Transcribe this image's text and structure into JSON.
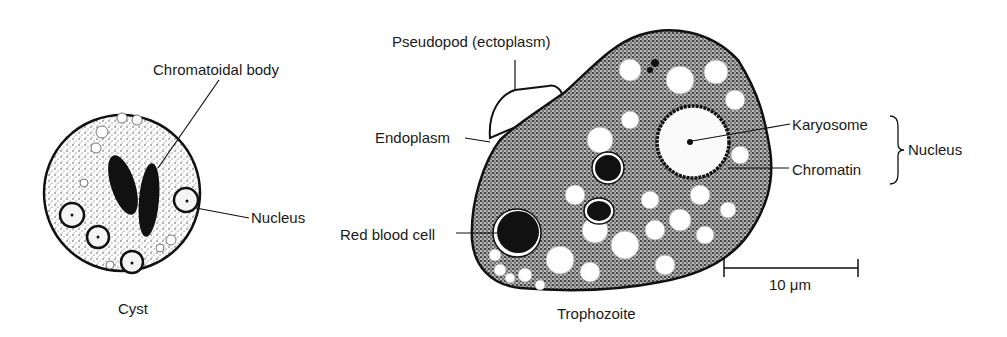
{
  "figure": {
    "cyst": {
      "caption": "Cyst",
      "labels": {
        "chromatoidal_body": "Chromatoidal body",
        "nucleus": "Nucleus"
      }
    },
    "trophozoite": {
      "caption": "Trophozoite",
      "labels": {
        "pseudopod": "Pseudopod (ectoplasm)",
        "endoplasm": "Endoplasm",
        "red_blood_cell": "Red blood cell",
        "karyosome": "Karyosome",
        "chromatin": "Chromatin",
        "nucleus_group": "Nucleus"
      }
    },
    "scale_bar": {
      "label": "10 μm"
    },
    "colors": {
      "ink": "#111111",
      "background": "#ffffff",
      "stipple": "#555555"
    }
  }
}
